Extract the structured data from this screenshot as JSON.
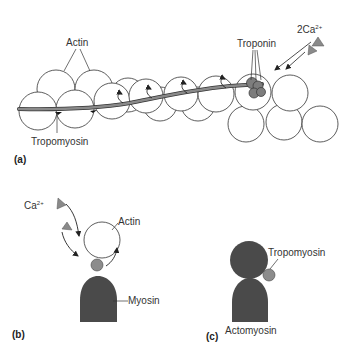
{
  "figure": {
    "colors": {
      "outline": "#333333",
      "actin_fill": "#ffffff",
      "tropomyosin_rod": "#7a7a7a",
      "troponin": "#7d7d7d",
      "calcium_ion": "#8a8a8a",
      "myosin": "#4a4a4a",
      "tropomyosin_bead": "#8c8c8c"
    },
    "panel_a": {
      "label": "(a)",
      "actin_label": "Actin",
      "tropomyosin_label": "Tropomyosin",
      "troponin_label": "Troponin",
      "calcium_label": "2Ca",
      "calcium_charge": "2+"
    },
    "panel_b": {
      "label": "(b)",
      "calcium_label": "Ca",
      "calcium_charge": "2+",
      "actin_label": "Actin",
      "myosin_label": "Myosin"
    },
    "panel_c": {
      "label": "(c)",
      "tropomyosin_label": "Tropomyosin",
      "actomyosin_label": "Actomyosin"
    }
  }
}
